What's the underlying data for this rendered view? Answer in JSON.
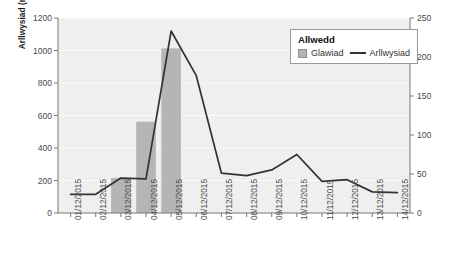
{
  "chart_data": {
    "type": "bar",
    "title": "",
    "subtitle": "",
    "xlabel": "",
    "ylabel": "Arllwysiad (metrau ciwbig yr eiliad – cumecs)",
    "ylabel_secondary": "Glawiad (mm)",
    "categories": [
      "01/12/2015",
      "02/12/2015",
      "03/12/2015",
      "04/12/2015",
      "05/12/2015",
      "06/12/2015",
      "07/12/2015",
      "08/12/2015",
      "09/12/2015",
      "10/12/2015",
      "11/12/2015",
      "12/12/2015",
      "13/12/2015",
      "14/12/2015"
    ],
    "ylim": [
      0,
      1200
    ],
    "ylim_secondary": [
      0,
      250
    ],
    "yticks": [
      0,
      200,
      400,
      600,
      800,
      1000,
      1200
    ],
    "yticks_secondary": [
      0,
      50,
      100,
      150,
      200,
      250
    ],
    "grid": true,
    "legend_position": "top-right",
    "series": [
      {
        "name": "Glawiad",
        "type": "bar",
        "axis": "secondary",
        "unit": "mm",
        "values": [
          0,
          0,
          45,
          117,
          211,
          0,
          0,
          0,
          0,
          0,
          0,
          0,
          0,
          0
        ]
      },
      {
        "name": "Arllwysiad",
        "type": "line",
        "axis": "primary",
        "unit": "cumecs",
        "values": [
          115,
          115,
          215,
          210,
          1120,
          845,
          245,
          230,
          265,
          360,
          195,
          205,
          130,
          125
        ]
      }
    ]
  },
  "legend": {
    "title": "Allwedd",
    "items": [
      {
        "label": "Glawiad",
        "marker": "swatch",
        "color": "#b5b5b5"
      },
      {
        "label": "Arllwysiad",
        "marker": "line",
        "color": "#333333"
      }
    ]
  },
  "colors": {
    "plot_background": "#efefef",
    "gridline": "#fbfbfb",
    "bar_fill": "#b5b5b5",
    "line_stroke": "#333333",
    "axis": "#777777",
    "tick_text": "#4a4a4a",
    "axis_title": "#1a1a1a",
    "legend_border": "#9a9a9a",
    "legend_background": "#ffffff"
  }
}
